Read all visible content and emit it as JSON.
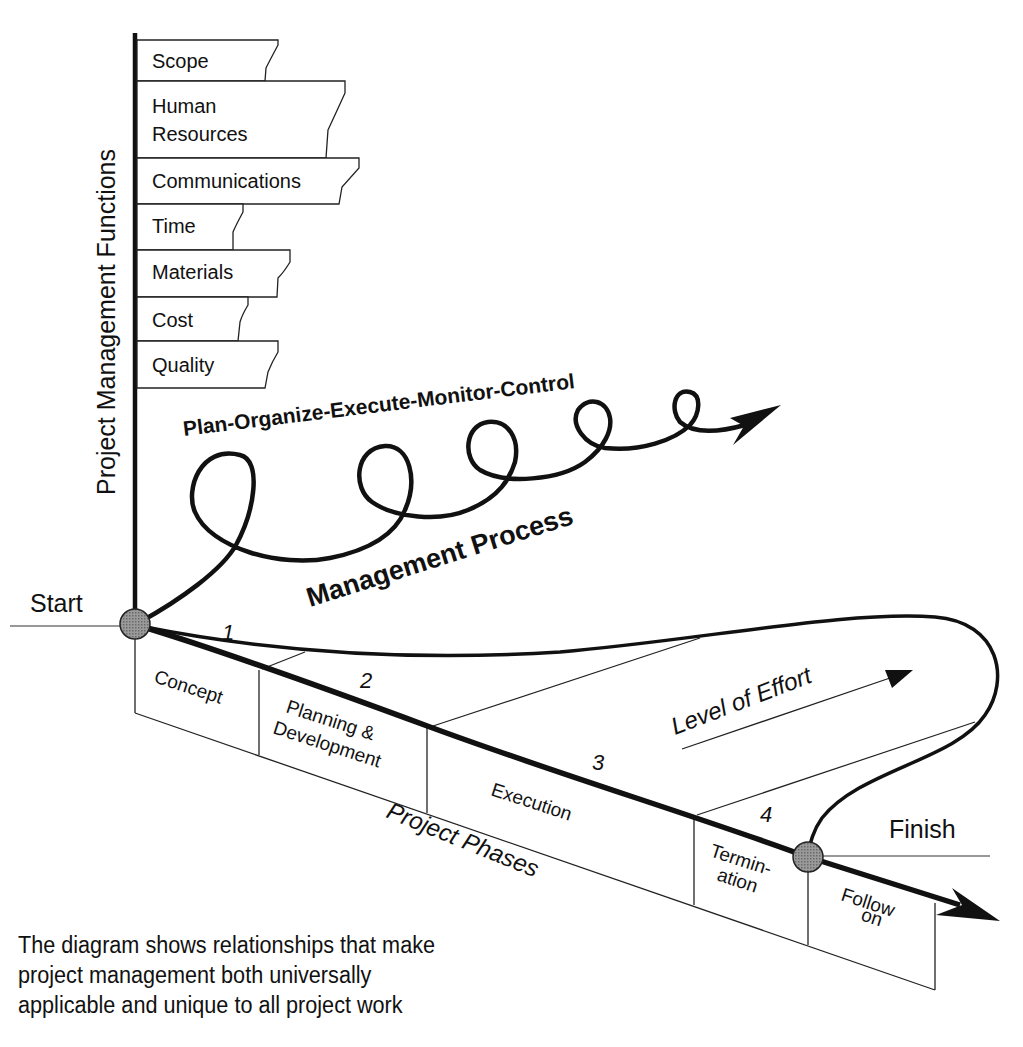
{
  "diagram": {
    "vertical_axis_label": "Project Management Functions",
    "functions": [
      {
        "label_lines": [
          "Scope"
        ]
      },
      {
        "label_lines": [
          "Human",
          "Resources"
        ]
      },
      {
        "label_lines": [
          "Communications"
        ]
      },
      {
        "label_lines": [
          "Time"
        ]
      },
      {
        "label_lines": [
          "Materials"
        ]
      },
      {
        "label_lines": [
          "Cost"
        ]
      },
      {
        "label_lines": [
          "Quality"
        ]
      }
    ],
    "process_label": "Plan-Organize-Execute-Monitor-Control",
    "management_process_label": "Management Process",
    "start_label": "Start",
    "finish_label": "Finish",
    "phase_axis_label": "Project Phases",
    "level_of_effort_label": "Level of Effort",
    "phases": [
      {
        "number": "1",
        "label_lines": [
          "Concept"
        ]
      },
      {
        "number": "2",
        "label_lines": [
          "Planning &",
          "Development"
        ]
      },
      {
        "number": "3",
        "label_lines": [
          "Execution"
        ]
      },
      {
        "number": "4",
        "label_lines": [
          "Termin-",
          "ation"
        ]
      },
      {
        "number": "",
        "label_lines": [
          "Follow",
          "on"
        ]
      }
    ],
    "caption_lines": [
      "The diagram shows relationships that make",
      "project management both universally",
      "applicable and unique to all project work"
    ]
  }
}
